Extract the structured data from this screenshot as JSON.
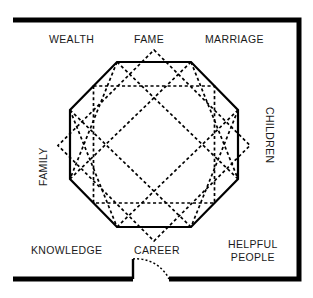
{
  "diagram": {
    "colors": {
      "wall": "#000000",
      "octagon_stroke": "#000000",
      "star_stroke": "#000000",
      "background": "#ffffff"
    },
    "labels": {
      "wealth": "WEALTH",
      "fame": "FAME",
      "marriage": "MARRIAGE",
      "children": "CHILDREN",
      "family": "FAMILY",
      "knowledge": "KNOWLEDGE",
      "career": "CAREER",
      "helpful_people_line1": "HELPFUL",
      "helpful_people_line2": "PEOPLE"
    },
    "shapes": {
      "room_outline": "M 13,20 L 299,20 L 299,279 L 169,279 M 133,279 L 13,279 Z",
      "door_leaf": "M 133,279 L 133,259",
      "door_arc": "M 133,259 A 36,36 0 0 1 169,279",
      "octagon_points": "117,62 191,62 238,110 238,179 191,227 117,227 70,179 70,110",
      "star_paths": [
        "M 117,62 L 238,179",
        "M 191,62 L 70,179",
        "M 238,110 L 117,227",
        "M 70,110 L 191,227",
        "M 117,62 L 70,179",
        "M 191,62 L 238,179",
        "M 70,110 L 117,227",
        "M 238,110 L 191,227",
        "M 93.5,86 L 214.5,86 L 214.5,203 L 93.5,203 Z",
        "M 154,50 L 250,145.5 L 154,241 L 58,145.5 Z"
      ]
    }
  }
}
